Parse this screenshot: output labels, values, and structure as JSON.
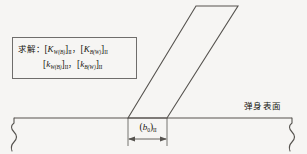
{
  "figure": {
    "background_color": "#f6f5f3",
    "line_color": "#56534f",
    "text_color": "#17150f"
  },
  "callout": {
    "lead": "求解：",
    "line1": {
      "term1": {
        "open": "[",
        "symbol": "K",
        "sub": "W(B)",
        "close": "]",
        "roman": "II"
      },
      "separator": "，",
      "term2": {
        "open": "[",
        "symbol": "K",
        "sub": "B(W)",
        "close": "]",
        "roman": "II"
      }
    },
    "line2": {
      "term1": {
        "open": "[",
        "symbol": "k",
        "sub": "W(B)",
        "close": "]",
        "roman": "II"
      },
      "separator": "，",
      "term2": {
        "open": "[",
        "symbol": "k",
        "sub": "B(W)",
        "close": "]",
        "roman": "II"
      }
    }
  },
  "labels": {
    "body_surface": "弹身表面",
    "chord": {
      "open": "(",
      "symbol": "b",
      "sub": "0",
      "close": ")",
      "roman": "II"
    }
  },
  "geometry": {
    "baseline_y": 118,
    "fin_root_leading_x": 128,
    "fin_root_trailing_x": 167,
    "fin_tip_leading_x": 196,
    "fin_tip_trailing_x": 238,
    "fin_tip_y": 6,
    "dimension_y": 139
  }
}
